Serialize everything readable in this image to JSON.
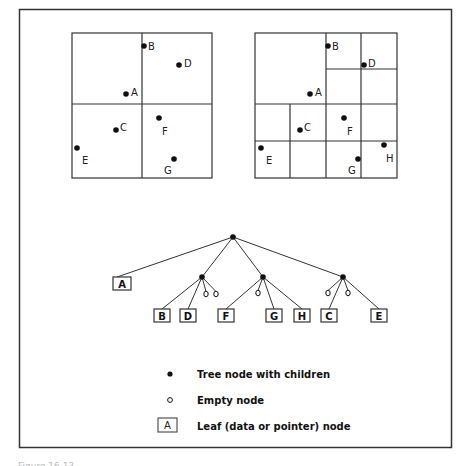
{
  "figure": {
    "left_quadtree": {
      "box": {
        "x": 72,
        "y": 33,
        "w": 140,
        "h": 145
      },
      "points": [
        {
          "label": "B",
          "x": 144,
          "y": 46,
          "lx": 148,
          "ly": 46
        },
        {
          "label": "D",
          "x": 179,
          "y": 65,
          "lx": 184,
          "ly": 63
        },
        {
          "label": "A",
          "x": 126,
          "y": 94,
          "lx": 131,
          "ly": 92
        },
        {
          "label": "C",
          "x": 116,
          "y": 130,
          "lx": 120,
          "ly": 127
        },
        {
          "label": "F",
          "x": 159,
          "y": 118,
          "lx": 162,
          "ly": 131
        },
        {
          "label": "E",
          "x": 77,
          "y": 148,
          "lx": 82,
          "ly": 160
        },
        {
          "label": "G",
          "x": 174,
          "y": 159,
          "lx": 164,
          "ly": 170
        }
      ]
    },
    "right_quadtree": {
      "box": {
        "x": 255,
        "y": 33,
        "w": 142,
        "h": 145
      },
      "points": [
        {
          "label": "B",
          "x": 328,
          "y": 46,
          "lx": 332,
          "ly": 46
        },
        {
          "label": "D",
          "x": 364,
          "y": 65,
          "lx": 368,
          "ly": 63
        },
        {
          "label": "A",
          "x": 310,
          "y": 94,
          "lx": 315,
          "ly": 92
        },
        {
          "label": "C",
          "x": 300,
          "y": 130,
          "lx": 304,
          "ly": 127
        },
        {
          "label": "F",
          "x": 344,
          "y": 118,
          "lx": 347,
          "ly": 131
        },
        {
          "label": "E",
          "x": 261,
          "y": 148,
          "lx": 266,
          "ly": 160
        },
        {
          "label": "G",
          "x": 358,
          "y": 159,
          "lx": 348,
          "ly": 170
        },
        {
          "label": "H",
          "x": 384,
          "y": 145,
          "lx": 386,
          "ly": 158
        }
      ]
    },
    "tree": {
      "root": {
        "x": 233,
        "y": 237
      },
      "internal_nodes": [
        {
          "x": 202,
          "y": 277
        },
        {
          "x": 263,
          "y": 277
        },
        {
          "x": 343,
          "y": 277
        }
      ],
      "empty_nodes": [
        {
          "x": 206,
          "y": 294
        },
        {
          "x": 216,
          "y": 294
        },
        {
          "x": 258,
          "y": 293
        },
        {
          "x": 328,
          "y": 293
        },
        {
          "x": 348,
          "y": 293
        }
      ],
      "leaves": [
        {
          "label": "A",
          "x": 113,
          "y": 277,
          "w": 18,
          "h": 13
        },
        {
          "label": "B",
          "x": 154,
          "y": 309,
          "w": 16,
          "h": 13
        },
        {
          "label": "D",
          "x": 180,
          "y": 309,
          "w": 16,
          "h": 13
        },
        {
          "label": "F",
          "x": 218,
          "y": 309,
          "w": 16,
          "h": 13
        },
        {
          "label": "G",
          "x": 266,
          "y": 309,
          "w": 16,
          "h": 13
        },
        {
          "label": "H",
          "x": 294,
          "y": 309,
          "w": 16,
          "h": 13
        },
        {
          "label": "C",
          "x": 321,
          "y": 309,
          "w": 16,
          "h": 13
        },
        {
          "label": "E",
          "x": 371,
          "y": 309,
          "w": 16,
          "h": 13
        }
      ]
    },
    "legend": {
      "items": [
        {
          "symbol": "filled-dot",
          "label": "Tree node with children"
        },
        {
          "symbol": "empty-dot",
          "label": "Empty node"
        },
        {
          "symbol": "leaf-box",
          "box_label": "A",
          "label": "Leaf (data or pointer) node"
        }
      ]
    },
    "caption": "Figure 16.13"
  }
}
